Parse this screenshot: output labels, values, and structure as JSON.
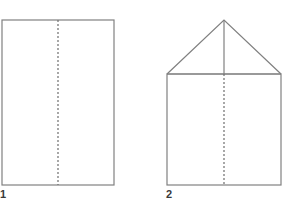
{
  "canvas": {
    "width": 284,
    "height": 216,
    "background_color": "#ffffff",
    "stroke_color": "#808080",
    "dash_color": "#6e6e6e",
    "label_color": "#3a3a3a",
    "stroke_width": 1.2,
    "dash_pattern": "2 2"
  },
  "figures": [
    {
      "id": "figure-1",
      "label": "1",
      "shape_name": "rectangle",
      "label_position": {
        "x": 0,
        "y": 189
      },
      "outline": {
        "left": 2,
        "top": 20,
        "right": 114,
        "bottom": 185,
        "width": 112,
        "height": 165
      },
      "symmetry_lines": [
        {
          "name": "vertical-line-of-symmetry",
          "style": "dashed",
          "x1": 58,
          "y1": 20,
          "x2": 58,
          "y2": 185
        }
      ]
    },
    {
      "id": "figure-2",
      "label": "2",
      "shape_name": "pentagon-house",
      "label_position": {
        "x": 166,
        "y": 189
      },
      "outline": {
        "left": 167,
        "top": 74,
        "right": 281,
        "bottom": 185,
        "width": 114,
        "height": 111,
        "apex": {
          "x": 224,
          "y": 20
        }
      },
      "roof_base_line": {
        "name": "roof-base-horizontal",
        "style": "solid",
        "x1": 167,
        "y1": 74,
        "x2": 281,
        "y2": 74
      },
      "symmetry_lines": [
        {
          "name": "apex-to-roof-base-segment",
          "style": "solid",
          "x1": 224,
          "y1": 20,
          "x2": 224,
          "y2": 74
        },
        {
          "name": "vertical-line-of-symmetry",
          "style": "dashed",
          "x1": 224,
          "y1": 74,
          "x2": 224,
          "y2": 185
        }
      ]
    }
  ]
}
